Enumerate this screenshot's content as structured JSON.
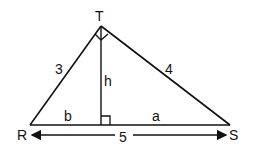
{
  "diagram": {
    "type": "right-triangle-with-altitude",
    "vertices": {
      "top": "T",
      "left": "R",
      "right": "S"
    },
    "sides": {
      "RT": "3",
      "TS": "4",
      "RS": "5"
    },
    "altitude_label": "h",
    "segments": {
      "left": "b",
      "right": "a"
    },
    "right_angles": [
      "T",
      "foot of altitude"
    ],
    "colors": {
      "stroke": "#111111",
      "background": "#ffffff"
    }
  }
}
